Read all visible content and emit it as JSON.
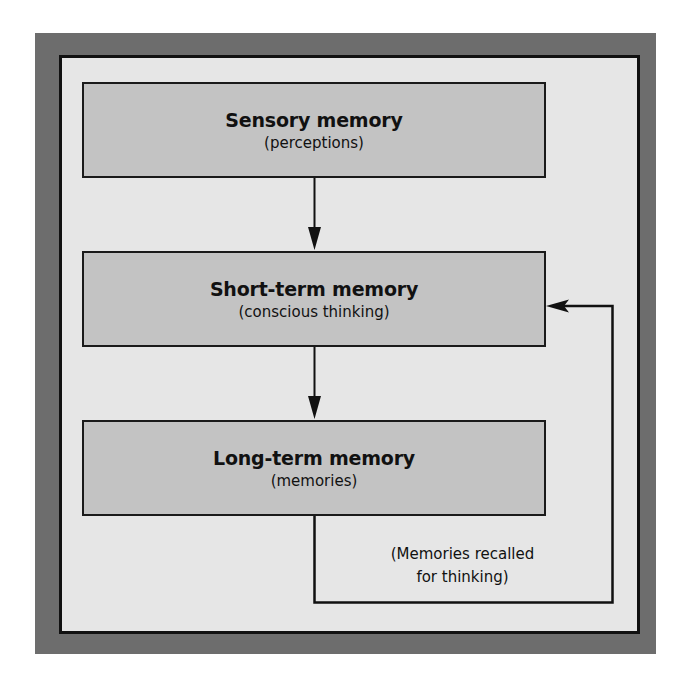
{
  "diagram": {
    "type": "flowchart",
    "colors": {
      "frame": "#6d6d6d",
      "panel": "#e6e6e6",
      "box_fill": "#c3c3c3",
      "line": "#111111"
    },
    "boxes": [
      {
        "id": "sensory",
        "title": "Sensory memory",
        "subtitle": "(perceptions)"
      },
      {
        "id": "short_term",
        "title": "Short-term memory",
        "subtitle": "(conscious thinking)"
      },
      {
        "id": "long_term",
        "title": "Long-term memory",
        "subtitle": "(memories)"
      }
    ],
    "edges": [
      {
        "from": "sensory",
        "to": "short_term"
      },
      {
        "from": "short_term",
        "to": "long_term"
      },
      {
        "from": "long_term",
        "to": "short_term",
        "label": "(Memories recalled for thinking)"
      }
    ],
    "feedback_label": {
      "line1": "(Memories recalled",
      "line2": "for thinking)"
    }
  }
}
